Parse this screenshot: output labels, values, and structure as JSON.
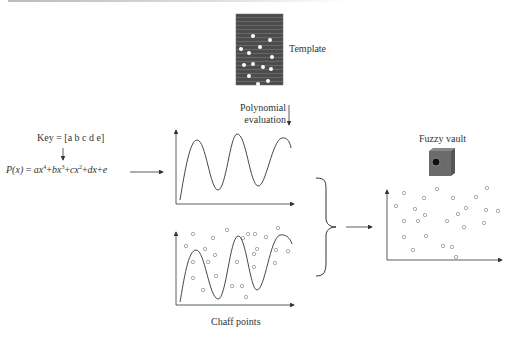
{
  "diagram": {
    "labels": {
      "template": "Template",
      "polynomial_line1": "Polynomial",
      "polynomial_line2": "evaluation",
      "key": "Key = [a b c d e]",
      "chaff": "Chaff points",
      "fuzzy_vault": "Fuzzy vault"
    },
    "equation": {
      "lhs": "P(x)",
      "eq": " = ",
      "terms": [
        {
          "coef": "ax",
          "exp": "4",
          "op": "+"
        },
        {
          "coef": "bx",
          "exp": "3",
          "op": "+"
        },
        {
          "coef": "cx",
          "exp": "2",
          "op": "+"
        },
        {
          "coef": "dx",
          "exp": "",
          "op": "+"
        },
        {
          "coef": "e",
          "exp": "",
          "op": ""
        }
      ]
    },
    "icons": {
      "fingerprint": "fingerprint-template-image",
      "safe": "safe-vault-icon"
    },
    "colors": {
      "line": "#333333",
      "point": "#888888",
      "fingerprint_bg": "#555555",
      "safe": "#6b6b6b"
    }
  }
}
